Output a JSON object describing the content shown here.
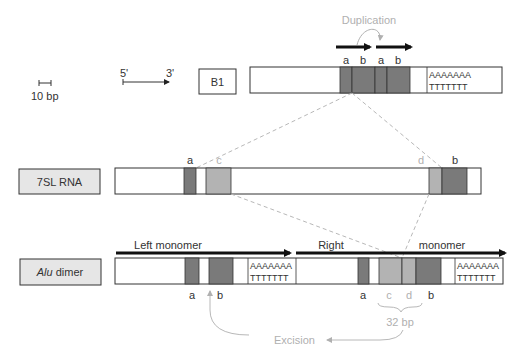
{
  "colors": {
    "dark_block": "#7a7a7a",
    "light_block": "#b3b3b3",
    "label_box_fill": "#e6e6e6",
    "gray_annotation": "#b0b0b0",
    "outline": "#3a3a3a"
  },
  "legend": {
    "scale_label": "10 bp",
    "direction_5": "5'",
    "direction_3": "3'"
  },
  "rows": {
    "b1": {
      "label": "B1",
      "segments": [
        "a",
        "b",
        "a",
        "b"
      ],
      "polyA": "AAAAAAA",
      "polyT": "TTTTTTT",
      "annotation": "Duplication"
    },
    "sl7": {
      "label": "7SL RNA",
      "segments": [
        "a",
        "c",
        "d",
        "b"
      ]
    },
    "alu": {
      "label_italic": "Alu",
      "label_rest": " dimer",
      "left_monomer_label": "Left monomer",
      "right_label": "Right",
      "monomer_label": "monomer",
      "left_segments": [
        "a",
        "b"
      ],
      "right_segments": [
        "a",
        "c",
        "d",
        "b"
      ],
      "polyA": "AAAAAAA",
      "polyT": "TTTTTTT",
      "bracket_label": "32 bp",
      "excision_label": "Excision"
    }
  }
}
